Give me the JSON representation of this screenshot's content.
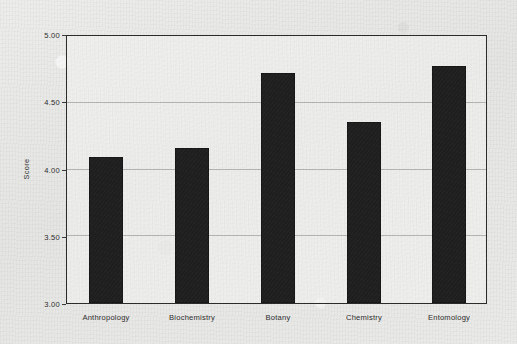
{
  "chart_data": {
    "type": "bar",
    "title": "",
    "xlabel": "",
    "ylabel": "Score",
    "categories": [
      "Anthropology",
      "Biochemistry",
      "Botany",
      "Chemistry",
      "Entomology"
    ],
    "values": [
      4.1,
      4.17,
      4.73,
      4.36,
      4.78
    ],
    "ylim": [
      3.0,
      5.0
    ],
    "ytick_labels": [
      "3.00",
      "3.50",
      "4.00",
      "4.50",
      "5.00"
    ],
    "ytick_values": [
      3.0,
      3.5,
      4.0,
      4.5,
      5.0
    ],
    "grid": true,
    "grid_axis": "y",
    "legend": false,
    "bar_color": "#1f1f1f",
    "plot_background": "#ededeb",
    "figure_background": "#e9e9e7",
    "axis_color": "#2a2a2a",
    "gridline_color": "#6e6e6e"
  }
}
